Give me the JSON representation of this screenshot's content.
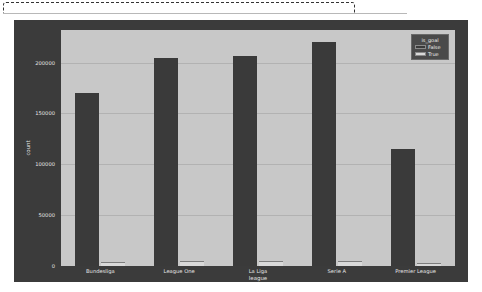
{
  "chart_data": {
    "type": "bar",
    "title": "",
    "xlabel": "league",
    "ylabel": "count",
    "categories": [
      "Bundesliga",
      "League One",
      "La Liga",
      "Serie A",
      "Premier League"
    ],
    "series": [
      {
        "name": "False",
        "values": [
          170000,
          204000,
          206000,
          220000,
          115000
        ],
        "color": "#3a3a3a"
      },
      {
        "name": "True",
        "values": [
          4000,
          4500,
          4800,
          4600,
          2800
        ],
        "color": "#d9d9d9"
      }
    ],
    "ylim": [
      0,
      232000
    ],
    "yticks": [
      0,
      50000,
      100000,
      150000,
      200000
    ],
    "ytick_labels": [
      "0",
      "50000",
      "100000",
      "150000",
      "200000"
    ],
    "grid": true,
    "legend": {
      "title": "is_goal",
      "position": "upper right",
      "entries": [
        "False",
        "True"
      ]
    }
  },
  "figure": {
    "facecolor": "#3b3b3b",
    "axes_facecolor": "#c8c8c8",
    "gridcolor": "#b2b2b2",
    "textcolor": "#e6e6e6"
  }
}
